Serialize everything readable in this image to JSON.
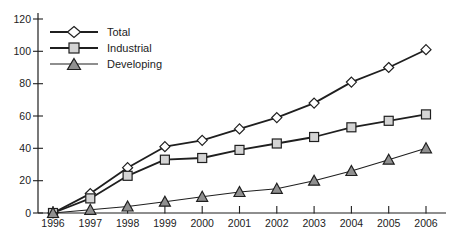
{
  "page": {
    "background": "#ffffff"
  },
  "chart_data": {
    "type": "line",
    "title": "",
    "xlabel": "",
    "ylabel": "",
    "x": [
      1996,
      1997,
      1998,
      1999,
      2000,
      2001,
      2002,
      2003,
      2004,
      2005,
      2006
    ],
    "x_tick_labels": [
      "1996",
      "1997",
      "1998",
      "1999",
      "2000",
      "2001",
      "2002",
      "2003",
      "2004",
      "2005",
      "2006"
    ],
    "y_ticks": [
      0,
      20,
      40,
      60,
      80,
      100,
      120
    ],
    "ylim": [
      0,
      120
    ],
    "grid": false,
    "legend_position": "top-left",
    "line_color": "#1f1f1f",
    "axis_color": "#1f1f1f",
    "series": [
      {
        "name": "Total",
        "marker": "diamond",
        "marker_fill": "#ffffff",
        "line_width": 1.8,
        "values": [
          0,
          12,
          28,
          41,
          45,
          52,
          59,
          68,
          81,
          90,
          101
        ]
      },
      {
        "name": "Industrial",
        "marker": "square",
        "marker_fill": "#d4d4d4",
        "line_width": 1.8,
        "values": [
          0,
          9,
          23,
          33,
          34,
          39,
          43,
          47,
          53,
          57,
          61
        ]
      },
      {
        "name": "Developing",
        "marker": "triangle",
        "marker_fill": "#909090",
        "line_width": 1.1,
        "values": [
          0,
          2,
          4,
          7,
          10,
          13,
          15,
          20,
          26,
          33,
          40
        ]
      }
    ]
  }
}
